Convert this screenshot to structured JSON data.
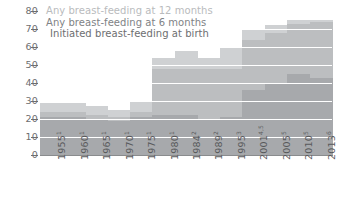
{
  "chart_data": {
    "type": "area",
    "title": "",
    "subtitle": "",
    "xlabel": "",
    "ylabel": "",
    "ylim": [
      0,
      80
    ],
    "yticks": [
      0,
      10,
      20,
      30,
      40,
      50,
      60,
      70,
      80
    ],
    "grid": "horizontal-white",
    "legend_position": "top-left-inside",
    "categories": [
      "1955",
      "1960",
      "1965",
      "1970",
      "1975",
      "1980",
      "1984",
      "1989",
      "1995",
      "2001",
      "2005",
      "2010",
      "2013"
    ],
    "category_footnotes": [
      "1",
      "1",
      "1",
      "1",
      "1",
      "1",
      "2",
      "2",
      "3",
      "4,5",
      "5",
      "5",
      "6"
    ],
    "category_labels": [
      "1955",
      "1960",
      "1965",
      "1970",
      "1975",
      "1980",
      "1984",
      "1989",
      "1995",
      "2001",
      "2005",
      "2010",
      "2013"
    ],
    "series": [
      {
        "name": "Initiated breast-feeding at birth",
        "color": "#cfd1d3",
        "values": [
          29,
          29,
          27,
          25,
          30,
          54,
          58,
          54,
          60,
          70,
          72,
          75,
          75
        ]
      },
      {
        "name": "Any breast-feeding at 6 months",
        "color": "#bcbec0",
        "values": [
          24,
          24,
          22,
          21,
          24,
          48,
          48,
          48,
          48,
          64,
          68,
          73,
          74
        ]
      },
      {
        "name": "Any breast-feeding at 12 months",
        "color": "#a7a9ac",
        "values": [
          21,
          21,
          20,
          19,
          21,
          22,
          22,
          20,
          21,
          36,
          40,
          45,
          43
        ]
      }
    ]
  },
  "legend": {
    "items": [
      {
        "label": "Any breast-feeding at 12 months",
        "color": "#b9bbbd"
      },
      {
        "label": "Any breast-feeding at 6 months",
        "color": "#808285"
      },
      {
        "label": "Initiated breast-feeding at birth",
        "color": "#6d6e70"
      }
    ]
  },
  "axis": {
    "y_tick_labels": [
      "80",
      "70",
      "60",
      "50",
      "40",
      "30",
      "20",
      "10",
      "0"
    ]
  },
  "colors": {
    "background": "#ffffff",
    "baseline": "#8a8c8e",
    "gridline": "#ffffff",
    "tick_text": "#6d6e70"
  }
}
